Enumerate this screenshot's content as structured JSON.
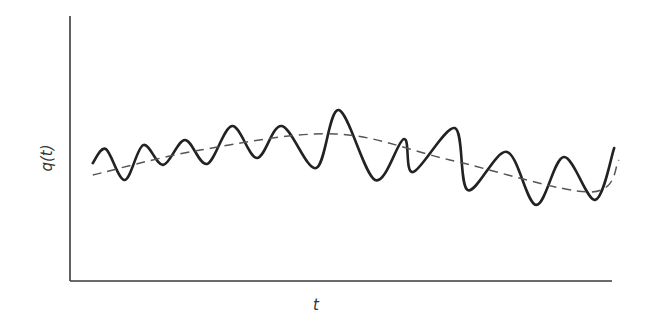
{
  "chart_data": {
    "type": "line",
    "title": "",
    "xlabel": "t",
    "ylabel": "q(t)",
    "xlim": [
      0,
      1
    ],
    "ylim": [
      0,
      1
    ],
    "grid": false,
    "legend": "none",
    "x_ticks": [],
    "y_ticks": [],
    "series": [
      {
        "name": "signal",
        "style": "solid",
        "color": "#222222",
        "x": [
          0.042,
          0.066,
          0.101,
          0.135,
          0.172,
          0.212,
          0.253,
          0.299,
          0.345,
          0.391,
          0.454,
          0.496,
          0.563,
          0.616,
          0.633,
          0.71,
          0.734,
          0.806,
          0.86,
          0.911,
          0.969,
          1.004
        ],
        "y": [
          0.445,
          0.498,
          0.381,
          0.513,
          0.438,
          0.532,
          0.442,
          0.585,
          0.464,
          0.585,
          0.426,
          0.645,
          0.381,
          0.536,
          0.411,
          0.577,
          0.343,
          0.487,
          0.287,
          0.468,
          0.306,
          0.502
        ]
      },
      {
        "name": "trend",
        "style": "dashed",
        "color": "#555555",
        "x": [
          0.042,
          0.24,
          0.489,
          0.701,
          0.959,
          1.013
        ],
        "y": [
          0.4,
          0.494,
          0.555,
          0.457,
          0.336,
          0.457
        ]
      }
    ]
  }
}
